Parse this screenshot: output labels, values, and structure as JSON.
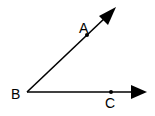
{
  "diagram": {
    "type": "angle",
    "line_color": "#000000",
    "background": "#ffffff",
    "vertex": {
      "label": "B",
      "x": 27,
      "y": 92
    },
    "points": [
      {
        "label": "A",
        "x": 87,
        "y": 35
      },
      {
        "label": "C",
        "x": 111,
        "y": 92
      }
    ],
    "rays": [
      {
        "name": "ray-BA",
        "from": "B",
        "through": "A",
        "tip": {
          "x": 116,
          "y": 7
        }
      },
      {
        "name": "ray-BC",
        "from": "B",
        "through": "C",
        "tip": {
          "x": 147,
          "y": 92
        }
      }
    ],
    "labels": {
      "A": "A",
      "B": "B",
      "C": "C"
    }
  }
}
